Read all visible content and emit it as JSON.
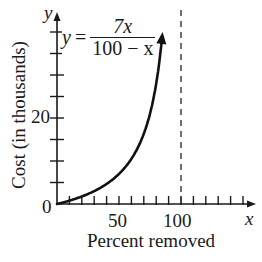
{
  "chart_data": {
    "type": "line",
    "title": "",
    "xlabel": "Percent removed",
    "ylabel": "Cost (in thousands)",
    "x_axis_var": "x",
    "y_axis_var": "y",
    "equation": {
      "lhs": "y",
      "numerator": "7x",
      "denominator": "100 − x",
      "text": "y = 7x / (100 − x)"
    },
    "x_ticks": {
      "labels": [
        "0",
        "50",
        "100"
      ],
      "minor_step": 10,
      "range": [
        0,
        160
      ]
    },
    "y_ticks": {
      "labels": [
        "0",
        "20"
      ],
      "minor_step": 5,
      "range": [
        0,
        45
      ]
    },
    "xlim": [
      0,
      160
    ],
    "ylim": [
      0,
      45
    ],
    "grid": false,
    "asymptote": {
      "type": "vertical",
      "x": 100,
      "style": "dashed"
    },
    "series": [
      {
        "name": "y = 7x/(100 − x)",
        "x": [
          0,
          10,
          20,
          30,
          40,
          50,
          60,
          70,
          75,
          80,
          84,
          86
        ],
        "y": [
          0,
          0.78,
          1.75,
          3.0,
          4.67,
          7.0,
          10.5,
          16.33,
          21.0,
          28.0,
          36.75,
          43.0
        ],
        "arrow_end": true
      }
    ]
  },
  "labels": {
    "origin": "0",
    "x50": "50",
    "x100": "100",
    "y20": "20",
    "xvar": "x",
    "yvar": "y",
    "xlabel": "Percent removed",
    "ylabel": "Cost (in thousands)",
    "eq_lhs": "y",
    "eq_equals": "=",
    "eq_num": "7x",
    "eq_den": "100 − x"
  }
}
